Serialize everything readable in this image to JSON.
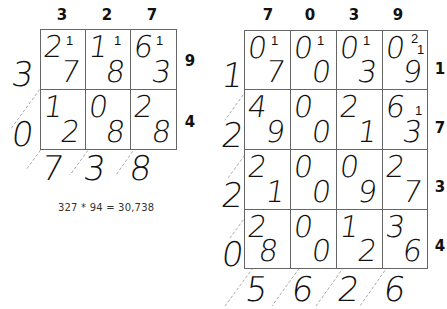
{
  "left_lattice": {
    "top_digits": [
      "3",
      "2",
      "7"
    ],
    "right_digits": [
      "9",
      "4"
    ],
    "cells": [
      [
        {
          "tens": "2",
          "ones": "7",
          "carry": "1"
        },
        {
          "tens": "1",
          "ones": "8",
          "carry": "1"
        },
        {
          "tens": "6",
          "ones": "3",
          "carry": "1"
        }
      ],
      [
        {
          "tens": "1",
          "ones": "2",
          "carry": ""
        },
        {
          "tens": "0",
          "ones": "8",
          "carry": ""
        },
        {
          "tens": "2",
          "ones": "8",
          "carry": ""
        }
      ]
    ],
    "left_result_digits": [
      "3",
      "0"
    ],
    "bottom_result_digits": [
      "7",
      "3",
      "8"
    ],
    "caption": "327 * 94 = 30,738"
  },
  "right_lattice": {
    "top_digits": [
      "7",
      "0",
      "3",
      "9"
    ],
    "right_digits": [
      "1",
      "7",
      "3",
      "4"
    ],
    "cells": [
      [
        {
          "tens": "0",
          "ones": "7",
          "carry": "1"
        },
        {
          "tens": "0",
          "ones": "0",
          "carry": "1"
        },
        {
          "tens": "0",
          "ones": "3",
          "carry": "1"
        },
        {
          "tens": "0",
          "ones": "9",
          "carry": "2",
          "carry2": "1"
        }
      ],
      [
        {
          "tens": "4",
          "ones": "9",
          "carry": ""
        },
        {
          "tens": "0",
          "ones": "0",
          "carry": ""
        },
        {
          "tens": "2",
          "ones": "1",
          "carry": ""
        },
        {
          "tens": "6",
          "ones": "3",
          "carry": "1"
        }
      ],
      [
        {
          "tens": "2",
          "ones": "1",
          "carry": ""
        },
        {
          "tens": "0",
          "ones": "0",
          "carry": ""
        },
        {
          "tens": "0",
          "ones": "9",
          "carry": ""
        },
        {
          "tens": "2",
          "ones": "7",
          "carry": ""
        }
      ],
      [
        {
          "tens": "2",
          "ones": "8",
          "carry": ""
        },
        {
          "tens": "0",
          "ones": "0",
          "carry": ""
        },
        {
          "tens": "1",
          "ones": "2",
          "carry": ""
        },
        {
          "tens": "3",
          "ones": "6",
          "carry": ""
        }
      ]
    ],
    "left_result_digits": [
      "1",
      "2",
      "2",
      "0"
    ],
    "bottom_result_digits": [
      "5",
      "6",
      "2",
      "6"
    ]
  }
}
